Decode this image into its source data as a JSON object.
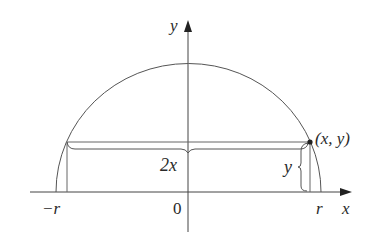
{
  "figure": {
    "labels": {
      "y_axis": "y",
      "x_axis": "x",
      "origin": "0",
      "neg_r": "−r",
      "pos_r": "r",
      "point": "(x, y)",
      "width": "2x",
      "height": "y"
    },
    "colors": {
      "stroke": "#555555",
      "text": "#2a2a2a",
      "background": "#ffffff"
    }
  }
}
